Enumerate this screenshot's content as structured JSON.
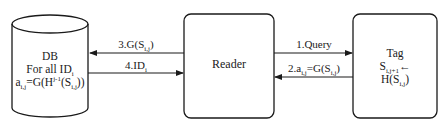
{
  "diagram": {
    "nodes": {
      "db": {
        "shape": "cylinder",
        "line1": "DB",
        "line2_base": "For all ID",
        "line2_sub": "i",
        "line3": {
          "a": "a",
          "a_sub": "i,j",
          "mid": "=G(H",
          "sup": "j-1",
          "s_open": "(S",
          "s_sub": "i,j",
          "close": "))"
        }
      },
      "reader": {
        "shape": "rounded-rect",
        "label": "Reader"
      },
      "tag": {
        "shape": "rounded-rect",
        "line1": "Tag",
        "line2_base": "S",
        "line2_sub": "i,j+1",
        "line2_arrow": "←",
        "line3_base": "H(S",
        "line3_sub": "i,j",
        "line3_close": ")"
      }
    },
    "edges": [
      {
        "id": "e1",
        "from": "reader",
        "to": "tag",
        "label_base": "1.Query"
      },
      {
        "id": "e2",
        "from": "tag",
        "to": "reader",
        "label_a": "2.a",
        "label_a_sub": "i,j",
        "label_mid": "=G(S",
        "label_sub": "i,j",
        "label_close": ")"
      },
      {
        "id": "e3",
        "from": "reader",
        "to": "db",
        "label_base": "3.G(S",
        "label_sub": "i,j",
        "label_close": ")"
      },
      {
        "id": "e4",
        "from": "db",
        "to": "reader",
        "label_base": "4.ID",
        "label_sub": "i"
      }
    ],
    "colors": {
      "stroke": "#1a1a1a",
      "background": "#ffffff"
    }
  }
}
